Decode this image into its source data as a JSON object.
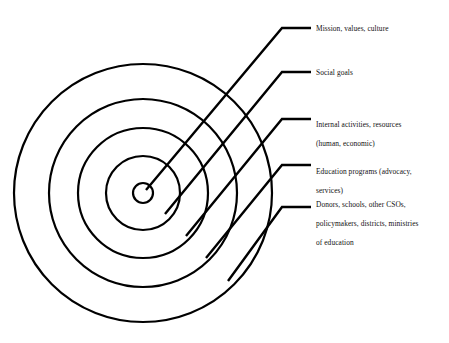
{
  "figure": {
    "type": "concentric-circles-diagram",
    "title": "",
    "background_color": "#ffffff",
    "stroke_color": "#000000",
    "text_color": "#111111",
    "center": {
      "x": 143,
      "y": 193
    },
    "ring_count": 5
  },
  "rings": [
    {
      "id": "ring-1-core",
      "order": 1,
      "radius": 10,
      "label": "Mission, values, culture",
      "label_lines": [
        "Mission, values, culture"
      ],
      "label_x": 316,
      "label_y": 21,
      "leader": {
        "start": {
          "x": 146,
          "y": 190
        },
        "elbow": {
          "x": 282,
          "y": 28
        },
        "end": {
          "x": 311,
          "y": 28
        }
      }
    },
    {
      "id": "ring-2",
      "order": 2,
      "radius": 37,
      "label": "Social goals",
      "label_lines": [
        "Social goals"
      ],
      "label_x": 316,
      "label_y": 66,
      "leader": {
        "start": {
          "x": 165,
          "y": 214
        },
        "elbow": {
          "x": 282,
          "y": 72
        },
        "end": {
          "x": 311,
          "y": 72
        }
      }
    },
    {
      "id": "ring-3",
      "order": 3,
      "radius": 65,
      "label": "Internal activities, resources (human, economic)",
      "label_lines": [
        "Internal activities, resources",
        "(human, economic)"
      ],
      "label_x": 316,
      "label_y": 111,
      "leader": {
        "start": {
          "x": 186,
          "y": 236
        },
        "elbow": {
          "x": 282,
          "y": 119
        },
        "end": {
          "x": 311,
          "y": 119
        }
      }
    },
    {
      "id": "ring-4",
      "order": 4,
      "radius": 94,
      "label": "Education programs (advocacy, services)",
      "label_lines": [
        "Education programs (advocacy,",
        "services)"
      ],
      "label_x": 316,
      "label_y": 156,
      "leader": {
        "start": {
          "x": 206,
          "y": 258
        },
        "elbow": {
          "x": 282,
          "y": 165
        },
        "end": {
          "x": 311,
          "y": 165
        }
      }
    },
    {
      "id": "ring-5-outer",
      "order": 5,
      "radius": 129,
      "label": "Donors, schools, other CSOs, policymakers, districts, ministries of education",
      "label_lines": [
        "Donors, schools, other CSOs,",
        "policymakers, districts, ministries",
        "of education"
      ],
      "label_x": 316,
      "label_y": 188,
      "leader": {
        "start": {
          "x": 228,
          "y": 281
        },
        "elbow": {
          "x": 282,
          "y": 207
        },
        "end": {
          "x": 311,
          "y": 207
        }
      }
    }
  ]
}
